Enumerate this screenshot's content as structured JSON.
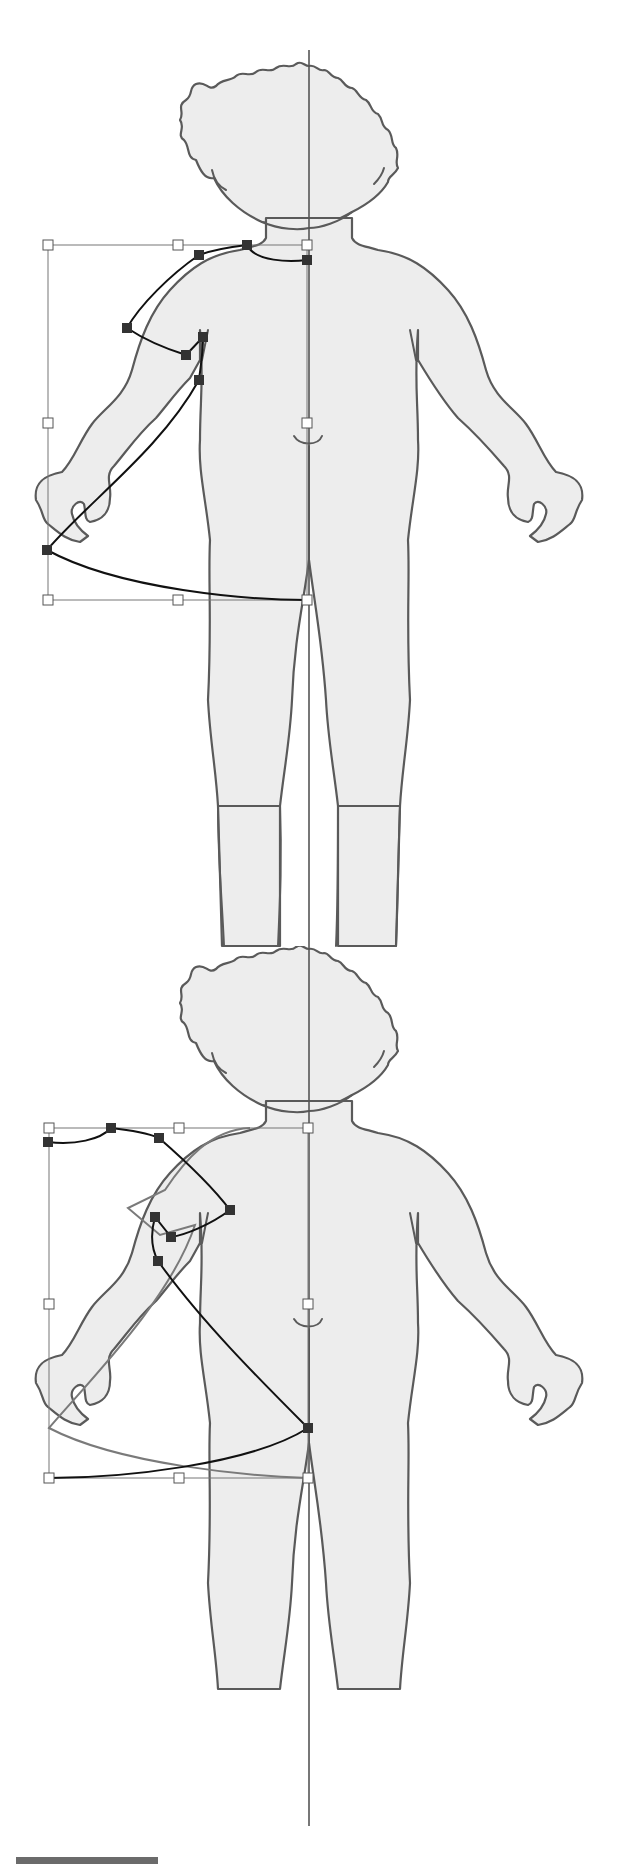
{
  "figure": {
    "colors": {
      "body_fill": "#ededed",
      "outline": "#5a5a5a",
      "anchor": "#333333",
      "path": "#111111",
      "ghost_path": "#7a7a7a",
      "handle_fill": "#ffffff"
    },
    "center_line": {
      "x": 309,
      "y1": 50,
      "y2": 1826
    },
    "panels": [
      {
        "name": "panel-top",
        "offset_y": 0,
        "bbox": {
          "x": 48,
          "y": 245,
          "w": 259,
          "h": 355
        },
        "handles": [
          [
            48,
            245
          ],
          [
            178,
            245
          ],
          [
            307,
            245
          ],
          [
            48,
            423
          ],
          [
            307,
            423
          ],
          [
            48,
            600
          ],
          [
            178,
            600
          ],
          [
            307,
            600
          ]
        ],
        "anchors": [
          [
            247,
            245
          ],
          [
            199,
            255
          ],
          [
            307,
            260
          ],
          [
            127,
            328
          ],
          [
            203,
            337
          ],
          [
            186,
            355
          ],
          [
            199,
            380
          ],
          [
            47,
            550
          ]
        ],
        "path_d": "M307,260 C290,262 255,262 247,245 C230,247 215,249 199,255 C170,275 140,305 127,328 C145,340 170,350 186,355 L203,337 C203,355 200,370 199,380 C160,450 90,500 47,550 C120,590 250,600 307,600"
      },
      {
        "name": "panel-bottom",
        "offset_y": 883,
        "bbox": {
          "x": 49,
          "y": 1128,
          "w": 259,
          "h": 350
        },
        "handles": [
          [
            49,
            1128
          ],
          [
            179,
            1128
          ],
          [
            308,
            1128
          ],
          [
            49,
            1304
          ],
          [
            308,
            1304
          ],
          [
            49,
            1478
          ],
          [
            179,
            1478
          ],
          [
            308,
            1478
          ]
        ],
        "anchors": [
          [
            48,
            1142
          ],
          [
            111,
            1128
          ],
          [
            159,
            1138
          ],
          [
            230,
            1210
          ],
          [
            155,
            1217
          ],
          [
            171,
            1237
          ],
          [
            158,
            1261
          ],
          [
            308,
            1428
          ]
        ],
        "path_d": "M48,1142 C75,1145 100,1140 111,1128 C130,1130 145,1132 159,1138 C190,1165 215,1190 230,1210 C210,1225 185,1235 171,1237 L155,1217 C150,1235 152,1250 158,1261 C200,1320 260,1380 308,1428 C250,1465 120,1478 49,1478",
        "ghost_d": "M250,1128 C210,1130 185,1160 165,1190 L128,1208 L160,1235 L195,1225 C170,1300 90,1380 49,1428 C120,1465 250,1476 308,1478"
      }
    ],
    "footer_bar": {
      "x": 16,
      "y": 1857,
      "w": 142,
      "h": 7,
      "color": "#6b6b6b"
    }
  }
}
